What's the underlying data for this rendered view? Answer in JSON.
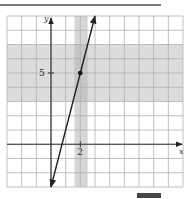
{
  "chart_data": {
    "type": "line",
    "title": "",
    "xlabel": "x",
    "ylabel": "y",
    "xlim": [
      -3,
      9
    ],
    "ylim": [
      -3,
      9
    ],
    "grid": true,
    "grid_step": 1,
    "tick_labels": {
      "x": [
        {
          "value": 2,
          "label": "2"
        }
      ],
      "y": [
        {
          "value": 5,
          "label": "5"
        }
      ]
    },
    "series": [
      {
        "name": "line",
        "equation": "y = 4x - 3",
        "x": [
          0,
          2,
          3
        ],
        "y": [
          -3,
          5,
          9
        ],
        "arrows_both_ends": true
      }
    ],
    "highlighted_point": {
      "x": 2,
      "y": 5
    },
    "shaded_regions": [
      {
        "orientation": "horizontal",
        "from": 3,
        "to": 7,
        "color": "#dcdcdc"
      },
      {
        "orientation": "vertical",
        "from": 1.6,
        "to": 2.5,
        "color": "#d6d6d6"
      }
    ]
  },
  "labels": {
    "x_axis": "x",
    "y_axis": "y",
    "x_tick_2": "2",
    "y_tick_5": "5"
  },
  "colors": {
    "grid": "#b0b0b0",
    "axis": "#333333",
    "line": "#222222",
    "band": "#dcdcdc",
    "overlap": "#c6c6c6"
  }
}
